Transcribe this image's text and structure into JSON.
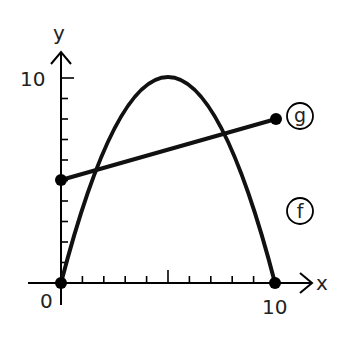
{
  "diagram": {
    "x_axis_label": "x",
    "y_axis_label": "y",
    "origin_label": "0",
    "x_max_label": "10",
    "y_max_label": "10",
    "x_range": [
      0,
      10
    ],
    "y_range": [
      0,
      10
    ],
    "x_ticks": [
      1,
      2,
      3,
      4,
      5,
      6,
      7,
      8,
      9
    ],
    "y_ticks": [
      1,
      2,
      3,
      4,
      5,
      6,
      7,
      8,
      9,
      10
    ],
    "functions": [
      {
        "name": "f",
        "label": "f",
        "type": "parabola",
        "description": "downward parabola through (0,0), vertex (5,10), and (10,0)",
        "points": [
          [
            0,
            0
          ],
          [
            5,
            10
          ],
          [
            10,
            0
          ]
        ],
        "endpoints": [
          [
            0,
            0
          ],
          [
            10,
            0
          ]
        ]
      },
      {
        "name": "g",
        "label": "g",
        "type": "line",
        "description": "line segment from (0,5) to (10,8)",
        "points": [
          [
            0,
            5
          ],
          [
            10,
            8
          ]
        ],
        "endpoints": [
          [
            0,
            5
          ],
          [
            10,
            8
          ]
        ]
      }
    ],
    "colors": {
      "background": "#ffffff",
      "ink": "#000000"
    }
  }
}
